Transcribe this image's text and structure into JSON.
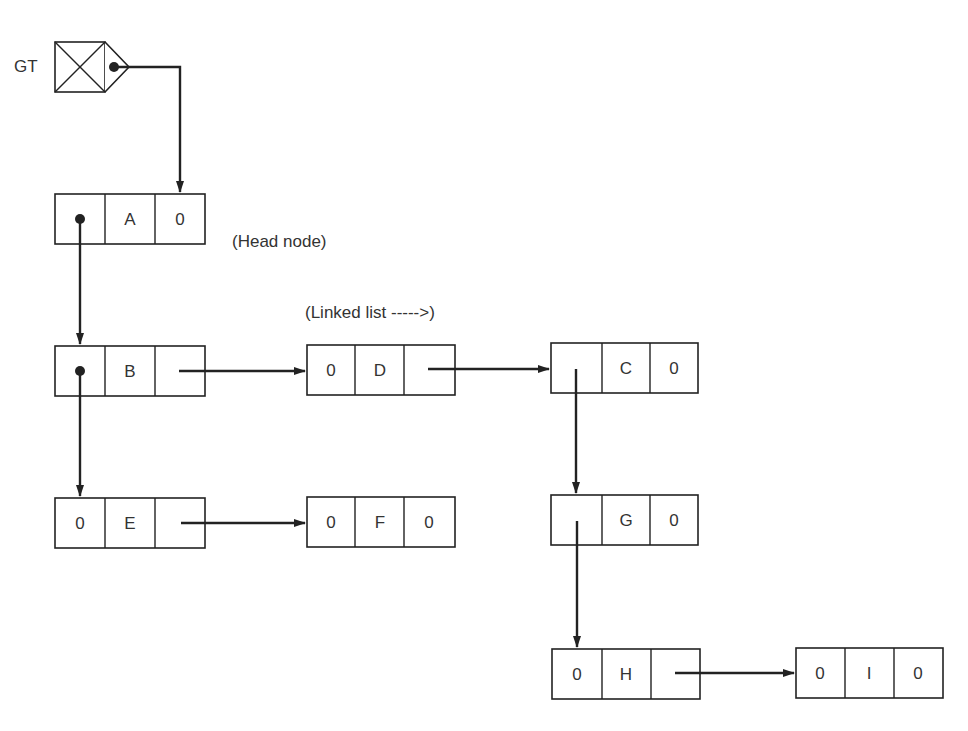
{
  "diagram": {
    "type": "generalized-list-structure",
    "gt_label": "GT",
    "head_node_label": "(Head node)",
    "linked_list_label": "(Linked list ----->)",
    "nodes": [
      {
        "id": "A",
        "cells": [
          "",
          "A",
          "0"
        ],
        "x": 55,
        "y": 194
      },
      {
        "id": "B",
        "cells": [
          "",
          "B",
          ""
        ],
        "x": 55,
        "y": 346
      },
      {
        "id": "D",
        "cells": [
          "0",
          "D",
          ""
        ],
        "x": 307,
        "y": 345
      },
      {
        "id": "C",
        "cells": [
          "",
          "C",
          "0"
        ],
        "x": 551,
        "y": 343
      },
      {
        "id": "E",
        "cells": [
          "0",
          "E",
          ""
        ],
        "x": 55,
        "y": 498
      },
      {
        "id": "F",
        "cells": [
          "0",
          "F",
          "0"
        ],
        "x": 307,
        "y": 497
      },
      {
        "id": "G",
        "cells": [
          "",
          "G",
          "0"
        ],
        "x": 551,
        "y": 495
      },
      {
        "id": "H",
        "cells": [
          "0",
          "H",
          ""
        ],
        "x": 552,
        "y": 649
      },
      {
        "id": "I",
        "cells": [
          "0",
          "I",
          "0"
        ],
        "x": 796,
        "y": 648
      }
    ],
    "edges": [
      {
        "from": "GT",
        "to": "A"
      },
      {
        "from": "A",
        "to": "B",
        "kind": "down"
      },
      {
        "from": "B",
        "to": "D",
        "kind": "next"
      },
      {
        "from": "D",
        "to": "C",
        "kind": "next"
      },
      {
        "from": "B",
        "to": "E",
        "kind": "down"
      },
      {
        "from": "E",
        "to": "F",
        "kind": "next"
      },
      {
        "from": "C",
        "to": "G",
        "kind": "down"
      },
      {
        "from": "G",
        "to": "H",
        "kind": "down"
      },
      {
        "from": "H",
        "to": "I",
        "kind": "next"
      }
    ]
  }
}
